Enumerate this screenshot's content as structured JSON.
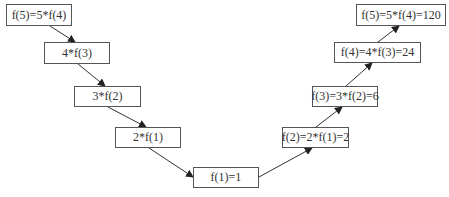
{
  "colors": {
    "border": "#555555",
    "text": "#333333",
    "edge": "#333333",
    "background": "#ffffff"
  },
  "nodes": [
    {
      "id": "n1",
      "label": "f(5)=5*f(4)",
      "x": 6,
      "y": 4,
      "w": 66,
      "h": 22
    },
    {
      "id": "n2",
      "label": "4*f(3)",
      "x": 44,
      "y": 42,
      "w": 66,
      "h": 22
    },
    {
      "id": "n3",
      "label": "3*f(2)",
      "x": 74,
      "y": 86,
      "w": 67,
      "h": 21
    },
    {
      "id": "n4",
      "label": "2*f(1)",
      "x": 115,
      "y": 127,
      "w": 66,
      "h": 21
    },
    {
      "id": "n5",
      "label": "f(1)=1",
      "x": 193,
      "y": 167,
      "w": 66,
      "h": 21
    },
    {
      "id": "n6",
      "label": "f(2)=2*f(1)=2",
      "x": 282,
      "y": 127,
      "w": 67,
      "h": 21
    },
    {
      "id": "n7",
      "label": "f(3)=3*f(2)=6",
      "x": 312,
      "y": 86,
      "w": 66,
      "h": 21
    },
    {
      "id": "n8",
      "label": "f(4)=4*f(3)=24",
      "x": 334,
      "y": 42,
      "w": 87,
      "h": 21
    },
    {
      "id": "n9",
      "label": "f(5)=5*f(4)=120",
      "x": 356,
      "y": 4,
      "w": 90,
      "h": 22
    }
  ],
  "edges": [
    {
      "from": "n1",
      "to": "n2",
      "x1": 50,
      "y1": 26,
      "x2": 75,
      "y2": 42
    },
    {
      "from": "n2",
      "to": "n3",
      "x1": 78,
      "y1": 64,
      "x2": 105,
      "y2": 86
    },
    {
      "from": "n3",
      "to": "n4",
      "x1": 108,
      "y1": 107,
      "x2": 146,
      "y2": 127
    },
    {
      "from": "n4",
      "to": "n5",
      "x1": 149,
      "y1": 148,
      "x2": 193,
      "y2": 177
    },
    {
      "from": "n5",
      "to": "n6",
      "x1": 259,
      "y1": 177,
      "x2": 312,
      "y2": 148
    },
    {
      "from": "n6",
      "to": "n7",
      "x1": 316,
      "y1": 127,
      "x2": 342,
      "y2": 107
    },
    {
      "from": "n7",
      "to": "n8",
      "x1": 346,
      "y1": 86,
      "x2": 372,
      "y2": 63
    },
    {
      "from": "n8",
      "to": "n9",
      "x1": 378,
      "y1": 42,
      "x2": 399,
      "y2": 26
    }
  ]
}
